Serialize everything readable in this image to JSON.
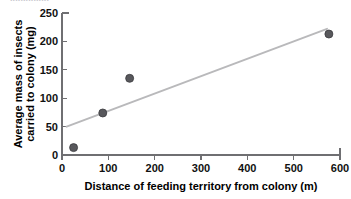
{
  "figure": {
    "top_cropped_text": "..............."
  },
  "chart_data": {
    "type": "scatter",
    "title": "",
    "xlabel": "Distance of feeding territory from colony (m)",
    "ylabel": "Average mass of insects carried to colony (mg)",
    "xlim": [
      0,
      600
    ],
    "ylim": [
      0,
      250
    ],
    "xticks": [
      0,
      100,
      200,
      300,
      400,
      500,
      600
    ],
    "yticks": [
      0,
      50,
      100,
      150,
      200,
      250
    ],
    "xtick_labels": [
      "0",
      "100",
      "200",
      "300",
      "400",
      "500",
      "600"
    ],
    "ytick_labels": [
      "0",
      "50",
      "100",
      "150",
      "200",
      "250"
    ],
    "grid": false,
    "legend": false,
    "legend_position": "none",
    "marker_color": "#58585c",
    "trendline_color": "#b9b9bb",
    "axis_color": "#6f6f72",
    "points": [
      {
        "x": 25,
        "y": 13
      },
      {
        "x": 88,
        "y": 74
      },
      {
        "x": 146,
        "y": 135
      },
      {
        "x": 576,
        "y": 213
      }
    ],
    "x": [
      25,
      88,
      146,
      576
    ],
    "y": [
      13,
      74,
      135,
      213
    ],
    "series": [
      {
        "name": "insect mass vs distance",
        "x": [
          25,
          88,
          146,
          576
        ],
        "values": [
          13,
          74,
          135,
          213
        ]
      }
    ],
    "trendline": {
      "type": "linear",
      "x_start": 10,
      "y_start": 50,
      "x_end": 572,
      "y_end": 222
    },
    "annotations": []
  }
}
